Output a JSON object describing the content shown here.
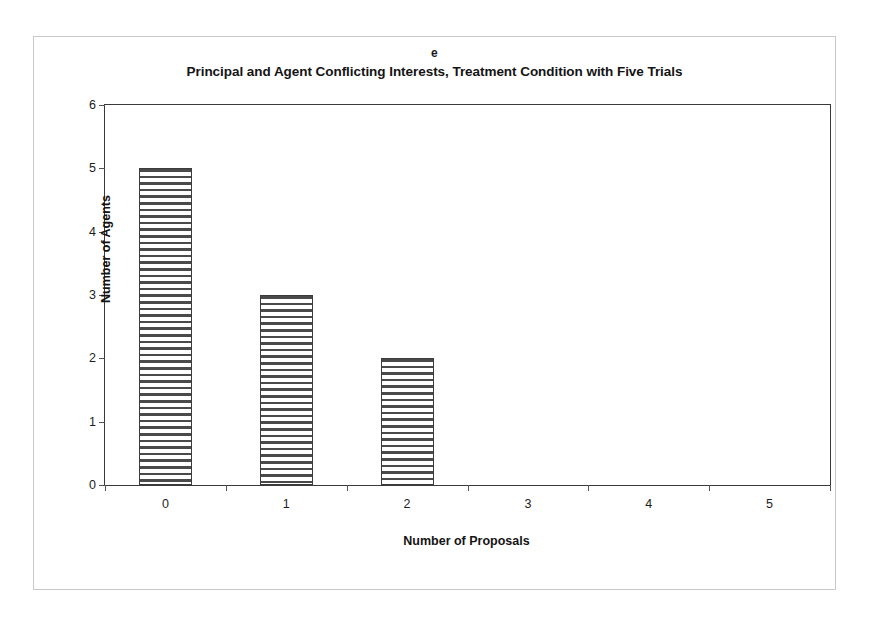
{
  "figure": {
    "panel_label": "e",
    "title": "Principal and Agent Conflicting Interests, Treatment Condition with Five Trials"
  },
  "chart_data": {
    "type": "bar",
    "title": "Principal and Agent Conflicting Interests, Treatment Condition with Five Trials",
    "panel_label": "e",
    "xlabel": "Number of Proposals",
    "ylabel": "Number of Agents",
    "categories": [
      "0",
      "1",
      "2",
      "3",
      "4",
      "5"
    ],
    "values": [
      5,
      3,
      2,
      0,
      0,
      0
    ],
    "ylim": [
      0,
      6
    ],
    "yticks": [
      0,
      1,
      2,
      3,
      4,
      5,
      6
    ],
    "grid": false,
    "legend": "none",
    "bar_fill": "horizontal-hatch",
    "bar_edge_color": "#3c3c3c",
    "bar_fill_color": "#4a4a4a"
  },
  "style": {
    "axis_color": "#3a3a3a",
    "tick_color": "#555555",
    "text_color": "#141414",
    "frame_color": "#c9c9c9",
    "background": "#ffffff"
  }
}
